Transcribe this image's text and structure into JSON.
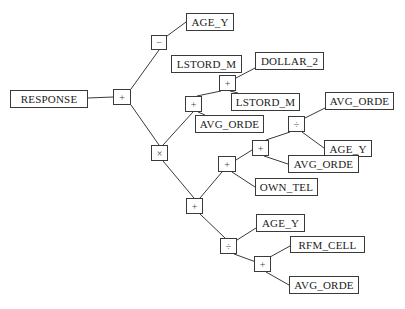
{
  "diagram": {
    "type": "expression-tree",
    "root": "RESPONSE",
    "colors": {
      "line": "#3a3a3a",
      "box_border": "#3a3a3a",
      "text": "#222222",
      "background": "#ffffff"
    },
    "nodes": {
      "response": "RESPONSE",
      "op_root": "+",
      "op_minus": "−",
      "age_y_1": "AGE_Y",
      "op_times": "×",
      "op_plus_a": "+",
      "lstord_m_1": "LSTORD_M",
      "op_plus_b": "+",
      "dollar_2": "DOLLAR_2",
      "lstord_m_2": "LSTORD_M",
      "avg_orde_1": "AVG_ORDE",
      "op_plus_c": "+",
      "op_plus_d": "+",
      "op_div_a": "÷",
      "avg_orde_2": "AVG_ORDE",
      "age_y_2": "AGE_Y",
      "avg_orde_3": "AVG_ORDE",
      "own_tel": "OWN_TEL",
      "op_div_b": "÷",
      "age_y_3": "AGE_Y",
      "op_plus_e": "+",
      "rfm_cell": "RFM_CELL",
      "avg_orde_4": "AVG_ORDE"
    }
  }
}
